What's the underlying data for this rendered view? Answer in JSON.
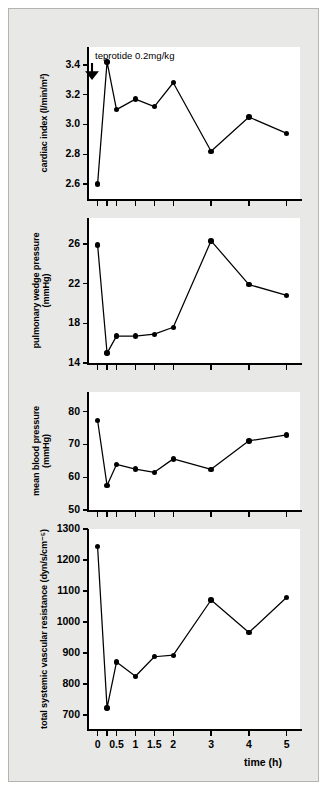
{
  "figure": {
    "background_color": "#e8e8e6",
    "plot_background_color": "#ffffff",
    "line_color": "#000000",
    "marker_color": "#000000"
  },
  "annotation": {
    "text": "teprotide 0.2mg/kg",
    "arrow_glyph": "↓",
    "arrow_name": "dose-arrow-icon",
    "at_time_h": 0
  },
  "xaxis": {
    "title": "time (h)",
    "tick_values": [
      0,
      0.25,
      0.5,
      1,
      1.5,
      2,
      3,
      4,
      5
    ],
    "tick_labels": [
      "0",
      "0.5",
      "1",
      "1.5",
      "2",
      "3",
      "4",
      "5"
    ],
    "labeled_values": [
      0,
      0.5,
      1,
      1.5,
      2,
      3,
      4,
      5
    ],
    "min": -0.28,
    "max": 5.35
  },
  "chart_data": [
    {
      "type": "line",
      "panel_index": 0,
      "title": "",
      "ylabel": "cardiac index (l/min/m²)",
      "ylabel_lines": [
        "cardiac index (l/min/m²)"
      ],
      "xlabel": "",
      "ylim": [
        2.5,
        3.52
      ],
      "yticks": [
        2.6,
        2.8,
        3.0,
        3.2,
        3.4
      ],
      "ytick_labels": [
        "2.6",
        "2.8",
        "3.0",
        "3.2",
        "3.4"
      ],
      "x": [
        0,
        0.25,
        0.5,
        1,
        1.5,
        2,
        3,
        4,
        5
      ],
      "values": [
        2.6,
        3.42,
        3.1,
        3.17,
        3.12,
        3.28,
        2.82,
        3.05,
        2.94
      ],
      "grid": false,
      "legend": "none"
    },
    {
      "type": "line",
      "panel_index": 1,
      "title": "",
      "ylabel": "pulmonary wedge pressure (mmHg)",
      "ylabel_lines": [
        "pulmonary wedge pressure",
        "(mmHg)"
      ],
      "xlabel": "",
      "ylim": [
        14,
        28.6
      ],
      "yticks": [
        14,
        18,
        22,
        26
      ],
      "ytick_labels": [
        "14",
        "18",
        "22",
        "26"
      ],
      "x": [
        0,
        0.25,
        0.5,
        1,
        1.5,
        2,
        3,
        4,
        5
      ],
      "values": [
        25.9,
        15.0,
        16.7,
        16.7,
        16.9,
        17.6,
        26.3,
        21.9,
        20.8
      ],
      "grid": false,
      "legend": "none"
    },
    {
      "type": "line",
      "panel_index": 2,
      "title": "",
      "ylabel": "mean blood pressure (mmHg)",
      "ylabel_lines": [
        "mean blood pressure",
        "(mmHg)"
      ],
      "xlabel": "",
      "ylim": [
        50,
        86
      ],
      "yticks": [
        50,
        60,
        70,
        80
      ],
      "ytick_labels": [
        "50",
        "60",
        "70",
        "80"
      ],
      "x": [
        0,
        0.25,
        0.5,
        1,
        1.5,
        2,
        3,
        4,
        5
      ],
      "values": [
        77.3,
        57.5,
        63.9,
        62.5,
        61.5,
        65.6,
        62.4,
        71.1,
        72.9
      ],
      "grid": false,
      "legend": "none"
    },
    {
      "type": "line",
      "panel_index": 3,
      "title": "",
      "ylabel": "total systemic vascular resistance (dyn/s/cm⁻⁵)",
      "ylabel_lines": [
        "total systemic vascular resistance (dyn/s/cm⁻⁵)"
      ],
      "xlabel": "time (h)",
      "ylim": [
        655,
        1300
      ],
      "yticks": [
        700,
        800,
        900,
        1000,
        1100,
        1200,
        1300
      ],
      "ytick_labels": [
        "700",
        "800",
        "900",
        "1000",
        "1100",
        "1200",
        "1300"
      ],
      "x": [
        0,
        0.25,
        0.5,
        1,
        1.5,
        2,
        3,
        4,
        5
      ],
      "values": [
        1243,
        723,
        871,
        825,
        888,
        893,
        1071,
        966,
        1080
      ],
      "grid": false,
      "legend": "none"
    }
  ]
}
